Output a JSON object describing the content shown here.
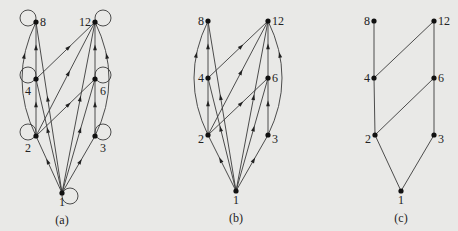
{
  "figure": {
    "panels": [
      {
        "id": "a",
        "caption": "(a)",
        "description": "Directed graph of divisibility relation on {1,2,3,4,6,8,12} with loops and all transitive edges",
        "nodes": [
          {
            "label": "1",
            "x": 62,
            "y": 193
          },
          {
            "label": "2",
            "x": 36,
            "y": 136
          },
          {
            "label": "3",
            "x": 95,
            "y": 136
          },
          {
            "label": "4",
            "x": 36,
            "y": 79
          },
          {
            "label": "6",
            "x": 95,
            "y": 79
          },
          {
            "label": "8",
            "x": 36,
            "y": 22
          },
          {
            "label": "12",
            "x": 95,
            "y": 22
          }
        ],
        "edges": [
          [
            "1",
            "2"
          ],
          [
            "1",
            "3"
          ],
          [
            "1",
            "4"
          ],
          [
            "1",
            "6"
          ],
          [
            "1",
            "8"
          ],
          [
            "1",
            "12"
          ],
          [
            "2",
            "4"
          ],
          [
            "2",
            "6"
          ],
          [
            "2",
            "8"
          ],
          [
            "2",
            "12"
          ],
          [
            "3",
            "6"
          ],
          [
            "3",
            "12"
          ],
          [
            "4",
            "8"
          ],
          [
            "4",
            "12"
          ],
          [
            "6",
            "12"
          ]
        ],
        "loops": [
          "1",
          "2",
          "3",
          "4",
          "6",
          "8",
          "12"
        ]
      },
      {
        "id": "b",
        "caption": "(b)",
        "description": "Same graph with loops removed",
        "nodes": [
          {
            "label": "1",
            "x": 236,
            "y": 191
          },
          {
            "label": "2",
            "x": 208,
            "y": 135
          },
          {
            "label": "3",
            "x": 268,
            "y": 135
          },
          {
            "label": "4",
            "x": 208,
            "y": 78
          },
          {
            "label": "6",
            "x": 268,
            "y": 78
          },
          {
            "label": "8",
            "x": 208,
            "y": 21
          },
          {
            "label": "12",
            "x": 268,
            "y": 21
          }
        ],
        "edges": [
          [
            "1",
            "2"
          ],
          [
            "1",
            "3"
          ],
          [
            "1",
            "4"
          ],
          [
            "1",
            "6"
          ],
          [
            "1",
            "8"
          ],
          [
            "1",
            "12"
          ],
          [
            "2",
            "4"
          ],
          [
            "2",
            "6"
          ],
          [
            "2",
            "8"
          ],
          [
            "2",
            "12"
          ],
          [
            "3",
            "6"
          ],
          [
            "3",
            "12"
          ],
          [
            "4",
            "8"
          ],
          [
            "4",
            "12"
          ],
          [
            "6",
            "12"
          ]
        ],
        "loops": []
      },
      {
        "id": "c",
        "caption": "(c)",
        "description": "Hasse diagram",
        "nodes": [
          {
            "label": "1",
            "x": 401,
            "y": 191
          },
          {
            "label": "2",
            "x": 375,
            "y": 135
          },
          {
            "label": "3",
            "x": 434,
            "y": 135
          },
          {
            "label": "4",
            "x": 374,
            "y": 78
          },
          {
            "label": "6",
            "x": 434,
            "y": 78
          },
          {
            "label": "8",
            "x": 374,
            "y": 21
          },
          {
            "label": "12",
            "x": 434,
            "y": 21
          }
        ],
        "edges": [
          [
            "1",
            "2"
          ],
          [
            "1",
            "3"
          ],
          [
            "2",
            "4"
          ],
          [
            "2",
            "6"
          ],
          [
            "3",
            "6"
          ],
          [
            "4",
            "8"
          ],
          [
            "4",
            "12"
          ],
          [
            "6",
            "12"
          ]
        ],
        "loops": []
      }
    ]
  }
}
